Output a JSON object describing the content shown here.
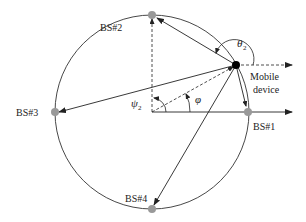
{
  "diagram": {
    "type": "geometry / localization diagram",
    "circle": {
      "cx": 152,
      "cy": 112,
      "r": 97,
      "stroke": "#333333"
    },
    "center": {
      "x": 152,
      "y": 112
    },
    "mobile_device": {
      "x": 236,
      "y": 65,
      "label_line1": "Mobile",
      "label_line2": "device",
      "color": "#000000"
    },
    "base_stations": [
      {
        "id": "bs1",
        "label": "BS#1",
        "x": 248,
        "y": 112
      },
      {
        "id": "bs2",
        "label": "BS#2",
        "x": 152,
        "y": 15
      },
      {
        "id": "bs3",
        "label": "BS#3",
        "x": 55,
        "y": 112
      },
      {
        "id": "bs4",
        "label": "BS#4",
        "x": 152,
        "y": 209
      }
    ],
    "bs_color": "#999999",
    "angles": {
      "theta2": {
        "symbol": "θ",
        "subscript": "2"
      },
      "psi2": {
        "symbol": "ψ",
        "subscript": "2"
      },
      "phi": {
        "symbol": "φ",
        "subscript": ""
      }
    }
  }
}
